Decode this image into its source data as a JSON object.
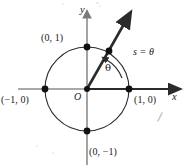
{
  "figure": {
    "colors": {
      "background": "#ffffff",
      "circle_stroke": "#2b2b2b",
      "axis_gray": "#8c8c8c",
      "ray_dark": "#2b2b2b",
      "point_fill": "#111111",
      "text": "#1a1a1a"
    },
    "axes": {
      "x_label": "x",
      "y_label": "y",
      "origin_label": "O"
    },
    "points": [
      {
        "name": "point-top",
        "label": "(0, 1)",
        "x": 0,
        "y": 1
      },
      {
        "name": "point-right",
        "label": "(1, 0)",
        "x": 1,
        "y": 0
      },
      {
        "name": "point-left",
        "label": "(−1, 0)",
        "x": -1,
        "y": 0
      },
      {
        "name": "point-bottom",
        "label": "(0, −1)",
        "x": 0,
        "y": -1
      }
    ],
    "annotations": {
      "arc_length": "s = θ",
      "angle": "θ"
    },
    "geometry": {
      "center_x": 87,
      "center_y": 89,
      "radius": 42,
      "ray_angle_deg": 58,
      "arc_sweep_deg": 58
    }
  }
}
